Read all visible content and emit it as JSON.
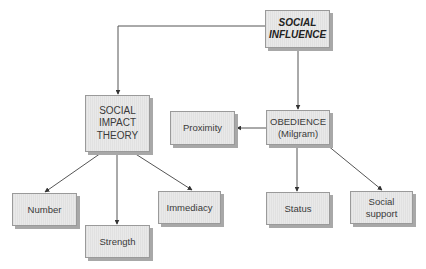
{
  "diagram": {
    "title": "Social Influence",
    "colors": {
      "node_fill": "#e9e9e9",
      "node_border": "#9a9a9a",
      "node_shadow": "#a8a8a8",
      "line": "#555555",
      "text": "#3a3a3a"
    },
    "nodes": {
      "social_influence": {
        "label": "SOCIAL\nINFLUENCE"
      },
      "social_impact_theory": {
        "label": "SOCIAL\nIMPACT\nTHEORY"
      },
      "obedience": {
        "label": "OBEDIENCE\n(Milgram)"
      },
      "proximity": {
        "label": "Proximity"
      },
      "number": {
        "label": "Number"
      },
      "strength": {
        "label": "Strength"
      },
      "immediacy": {
        "label": "Immediacy"
      },
      "status": {
        "label": "Status"
      },
      "social_support": {
        "label": "Social\nsupport"
      }
    },
    "edges": [
      {
        "from": "social_influence",
        "to": "social_impact_theory"
      },
      {
        "from": "social_influence",
        "to": "obedience"
      },
      {
        "from": "obedience",
        "to": "proximity"
      },
      {
        "from": "social_impact_theory",
        "to": "number"
      },
      {
        "from": "social_impact_theory",
        "to": "strength"
      },
      {
        "from": "social_impact_theory",
        "to": "immediacy"
      },
      {
        "from": "obedience",
        "to": "status"
      },
      {
        "from": "obedience",
        "to": "social_support"
      }
    ]
  }
}
